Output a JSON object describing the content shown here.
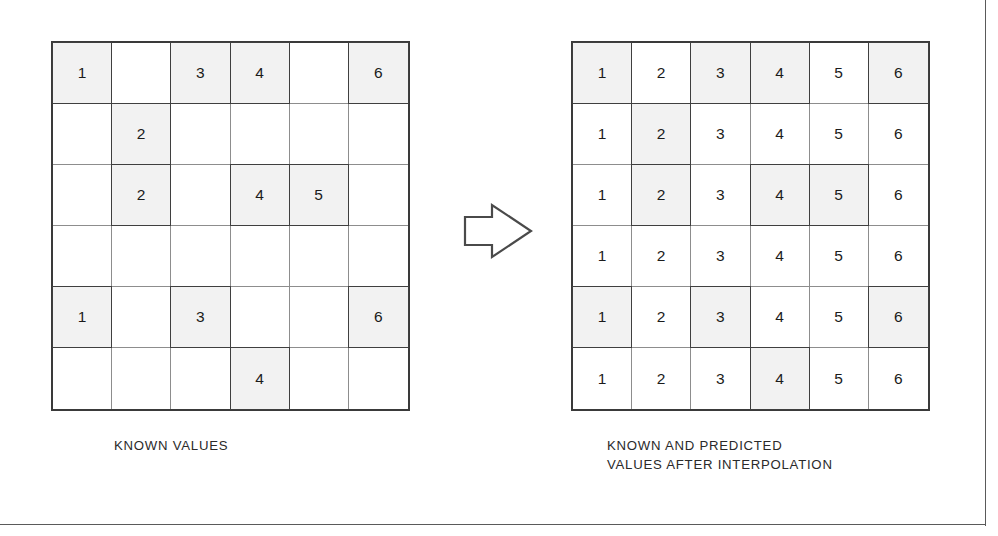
{
  "figure": {
    "colors": {
      "known_cell_fill": "#f2f2f2",
      "unknown_cell_fill": "#ffffff",
      "grid_outer_border": "#3a3a3a",
      "grid_inner_border": "#8d8d8d",
      "known_cell_border": "#3f3f3f",
      "text": "#1b1b1b",
      "rule": "#5a5a5a"
    }
  },
  "left_panel": {
    "caption": "KNOWN VALUES",
    "rows": 6,
    "columns": 6,
    "cells": [
      [
        "1",
        "",
        "3",
        "4",
        "",
        "6"
      ],
      [
        "",
        "2",
        "",
        "",
        "",
        ""
      ],
      [
        "",
        "2",
        "",
        "4",
        "5",
        ""
      ],
      [
        "",
        "",
        "",
        "",
        "",
        ""
      ],
      [
        "1",
        "",
        "3",
        "",
        "",
        "6"
      ],
      [
        "",
        "",
        "",
        "4",
        "",
        ""
      ]
    ],
    "known_mask": [
      [
        true,
        false,
        true,
        true,
        false,
        true
      ],
      [
        false,
        true,
        false,
        false,
        false,
        false
      ],
      [
        false,
        true,
        false,
        true,
        true,
        false
      ],
      [
        false,
        false,
        false,
        false,
        false,
        false
      ],
      [
        true,
        false,
        true,
        false,
        false,
        true
      ],
      [
        false,
        false,
        false,
        true,
        false,
        false
      ]
    ]
  },
  "arrow": {
    "name": "block-arrow-right",
    "direction": "right"
  },
  "right_panel": {
    "caption": "KNOWN AND PREDICTED\nVALUES AFTER INTERPOLATION",
    "caption_line_1": "KNOWN AND PREDICTED",
    "caption_line_2": "VALUES AFTER INTERPOLATION",
    "rows": 6,
    "columns": 6,
    "cells": [
      [
        "1",
        "2",
        "3",
        "4",
        "5",
        "6"
      ],
      [
        "1",
        "2",
        "3",
        "4",
        "5",
        "6"
      ],
      [
        "1",
        "2",
        "3",
        "4",
        "5",
        "6"
      ],
      [
        "1",
        "2",
        "3",
        "4",
        "5",
        "6"
      ],
      [
        "1",
        "2",
        "3",
        "4",
        "5",
        "6"
      ],
      [
        "1",
        "2",
        "3",
        "4",
        "5",
        "6"
      ]
    ],
    "known_mask": [
      [
        true,
        false,
        true,
        true,
        false,
        true
      ],
      [
        false,
        true,
        false,
        false,
        false,
        false
      ],
      [
        false,
        true,
        false,
        true,
        true,
        false
      ],
      [
        false,
        false,
        false,
        false,
        false,
        false
      ],
      [
        true,
        false,
        true,
        false,
        false,
        true
      ],
      [
        false,
        false,
        false,
        true,
        false,
        false
      ]
    ]
  }
}
